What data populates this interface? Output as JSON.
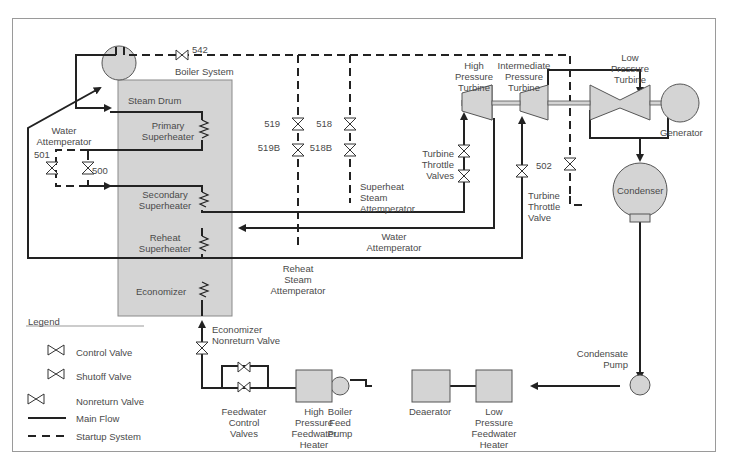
{
  "diagram": {
    "title": "Boiler System",
    "components": {
      "steam_drum": "Steam Drum",
      "primary_superheater": [
        "Primary",
        "Superheater"
      ],
      "secondary_superheater": [
        "Secondary",
        "Superheater"
      ],
      "reheat_superheater": [
        "Reheat",
        "Superheater"
      ],
      "economizer": "Economizer",
      "hp_turbine": [
        "High",
        "Pressure",
        "Turbine"
      ],
      "ip_turbine": [
        "Intermediate",
        "Pressure",
        "Turbine"
      ],
      "lp_turbine": [
        "Low",
        "Pressure",
        "Turbine"
      ],
      "generator": "Generator",
      "condenser": "Condenser",
      "condensate_pump": [
        "Condensate",
        "Pump"
      ],
      "lp_feedwater_heater": [
        "Low",
        "Pressure",
        "Feedwater",
        "Heater"
      ],
      "deaerator": "Deaerator",
      "boiler_feed_pump": [
        "Boiler",
        "Feed",
        "Pump"
      ],
      "hp_feedwater_heater": [
        "High",
        "Pressure",
        "Feedwater",
        "Heater"
      ],
      "feedwater_control_valves": [
        "Feedwater",
        "Control",
        "Valves"
      ],
      "economizer_nonreturn_valve": [
        "Economizer",
        "Nonreturn Valve"
      ],
      "water_attemperator_left": [
        "Water",
        "Attemperator"
      ],
      "water_attemperator_center": [
        "Water",
        "Attemperator"
      ],
      "superheat_steam_attemperator": [
        "Superheat",
        "Steam",
        "Attemperator"
      ],
      "reheat_steam_attemperator": [
        "Reheat",
        "Steam",
        "Attemperator"
      ],
      "turbine_throttle_valves": [
        "Turbine",
        "Throttle",
        "Valves"
      ],
      "turbine_throttle_valve": [
        "Turbine",
        "Throttle",
        "Valve"
      ]
    },
    "valve_tags": {
      "v542": "542",
      "v519": "519",
      "v519b": "519B",
      "v518": "518",
      "v518b": "518B",
      "v501": "501",
      "v500": "500",
      "v502": "502"
    },
    "colors": {
      "line": "#222222",
      "fill": "#d4d4d4",
      "text": "#4a4a4a",
      "frame": "#9a9a9a"
    }
  },
  "legend": {
    "title": "Legend",
    "items": [
      {
        "label": "Control Valve"
      },
      {
        "label": "Shutoff Valve"
      },
      {
        "label": "Nonreturn Valve"
      },
      {
        "label": "Main Flow"
      },
      {
        "label": "Startup System"
      }
    ]
  }
}
